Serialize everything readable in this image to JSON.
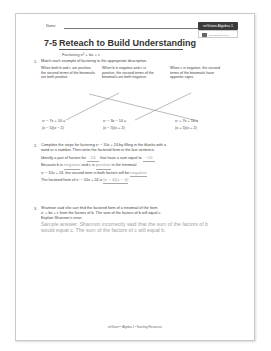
{
  "header": {
    "name_label": "Name",
    "badge_label": "enVision Algebra 1",
    "badge_sub_label": "savvasrealize.com"
  },
  "title": {
    "number": "7-5",
    "text": "Reteach to Build Understanding",
    "subtitle": "Factoring x² + bx + c"
  },
  "q1": {
    "num": "1.",
    "prompt": "Match each example of factoring to the appropriate description.",
    "descriptions": [
      "When both b and c are positive, the second terms of the binomials are both positive.",
      "When b is negative and c is positive, the second terms of the binomials are both negative.",
      "When c is negative, the second terms of the binomials have opposite signs."
    ],
    "examples": [
      {
        "expr": "x² − 7x + 10 =",
        "factored": "(x − 5)(x − 2)"
      },
      {
        "expr": "x² − 3x − 10 =",
        "factored": "(x − 5)(x + 2)"
      },
      {
        "expr": "x² + 7x + 10 =",
        "factored": "(x + 5)(x + 2)"
      }
    ]
  },
  "q2": {
    "num": "2.",
    "prompt_line1": "Complete the steps for factoring x² − 10x + 24 by filling in the blanks with a",
    "prompt_line2": "word or a number. Then write the factored form in the last sentence.",
    "s1_a": "Identify a pair of factors for",
    "s1_ans1": "24",
    "s1_b": "that have a sum equal to",
    "s1_ans2": "−10",
    "s2_a": "Because b is",
    "s2_ans1": "negative",
    "s2_b": "and c is",
    "s2_ans2": "positive",
    "s2_c": "in the trinomial",
    "s3_a": "x² − 10x + 24, the second term in both factors will be",
    "s3_ans": "negative",
    "s4_a": "The factored form of x² − 10x + 24 is",
    "s4_ans": "(x − 4)(x − 6)"
  },
  "q3": {
    "num": "3.",
    "prompt_line1": "Shannon said she can find the factored form of a trinomial of the form",
    "prompt_line2": "x² + bx + c from the factors of b. The sum of the factors of b will equal c.",
    "prompt_line3": "Explain Shannon's error.",
    "answer": "Sample answer: Shannon incorrectly said that the sum of the factors of b would equal c. The sum of the factors of c will equal b."
  },
  "footer": {
    "text": "enVision™ Algebra 1 • Teaching Resources"
  },
  "colors": {
    "answer": "#9aa0a8",
    "badge_bg": "#3a3a3a",
    "border": "#c9c9c9"
  }
}
